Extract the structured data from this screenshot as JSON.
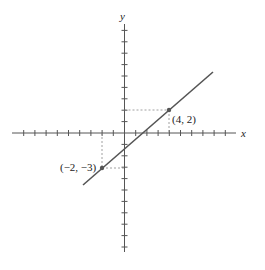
{
  "chart_data": {
    "type": "line",
    "title": "",
    "xlabel": "x",
    "ylabel": "y",
    "xlim": [
      -10,
      10
    ],
    "ylim": [
      -10,
      10
    ],
    "grid": false,
    "ticks_unlabeled": true,
    "series": [
      {
        "name": "line through (-2,-3) and (4,2)",
        "x": [
          -2,
          4
        ],
        "y": [
          -3,
          2
        ],
        "slope": 0.8333,
        "intercept": -1.3333
      }
    ],
    "points": [
      {
        "x": 4,
        "y": 2,
        "label": "(4, 2)"
      },
      {
        "x": -2,
        "y": -3,
        "label": "(−2, −3)"
      }
    ],
    "annotations": [
      "dashed projection lines from each labeled point to both axes"
    ]
  },
  "labels": {
    "x_axis": "x",
    "y_axis": "y",
    "point_a": "(4, 2)",
    "point_b": "(−2, −3)"
  },
  "colors": {
    "axis": "#555555",
    "line": "#555555",
    "guide": "#888888"
  }
}
